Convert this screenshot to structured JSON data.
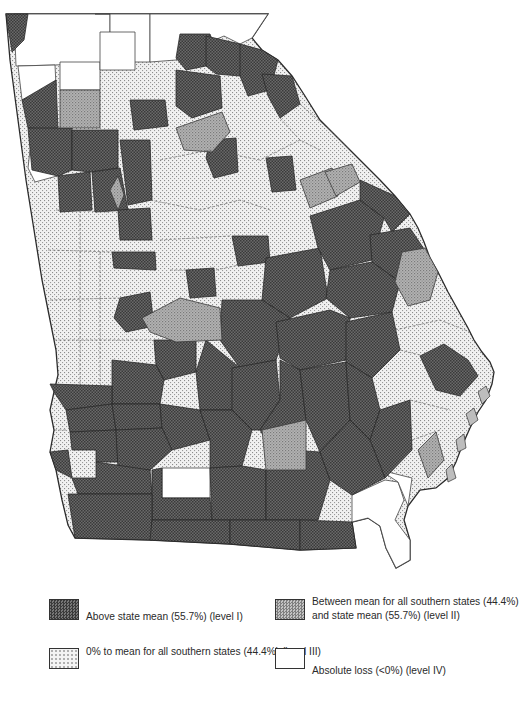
{
  "map": {
    "region": "Georgia",
    "unit": "county",
    "levels": {
      "I": {
        "key": "level1",
        "fill": "#5f5f5f",
        "pattern": "dense-dark-stipple"
      },
      "II": {
        "key": "level2",
        "fill": "#a9a9a9",
        "pattern": "medium-gray-stipple"
      },
      "III": {
        "key": "level3",
        "fill": "#dcdcdc",
        "pattern": "light-dot-stipple"
      },
      "IV": {
        "key": "level4",
        "fill": "#ffffff",
        "pattern": "blank"
      }
    },
    "outline_color": "#2b2b2b",
    "county_border_color": "#3a3a3a"
  },
  "legend": {
    "items": [
      {
        "level": "I",
        "label": "Above state mean (55.7%) (level I)"
      },
      {
        "level": "II",
        "label": "Between mean for all southern states (44.4%) and state mean (55.7%) (level II)"
      },
      {
        "level": "III",
        "label": "0% to mean for all southern states (44.4%) (level III)"
      },
      {
        "level": "IV",
        "label": "Absolute loss (<0%) (level IV)"
      }
    ]
  }
}
